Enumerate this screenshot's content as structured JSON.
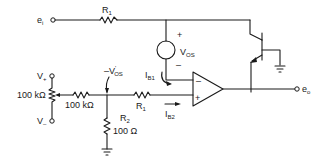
{
  "diagram": {
    "type": "circuit-schematic",
    "labels": {
      "input": "e",
      "input_sub": "i",
      "output": "e",
      "output_sub": "o",
      "r1_top": "R",
      "r1_top_sub": "1",
      "vos": "V",
      "vos_sub": "OS",
      "vos_plus": "+",
      "vos_minus": "–",
      "ib1": "I",
      "ib1_sub": "B1",
      "ib2": "I",
      "ib2_sub": "B2",
      "vos_prime": "–V",
      "vos_prime_sub": "OS",
      "vos_prime_mark": "'",
      "vplus": "V",
      "vplus_sub": "+",
      "vminus": "V",
      "vminus_sub": "–",
      "pot_value": "100 kΩ",
      "series_res_value": "100 kΩ",
      "r1_bottom": "R",
      "r1_bottom_sub": "1",
      "r2": "R",
      "r2_sub": "2",
      "r2_value": "100 Ω",
      "opamp_minus": "–",
      "opamp_plus": "+"
    },
    "components": [
      {
        "id": "R1-feedback",
        "type": "resistor",
        "label": "R1"
      },
      {
        "id": "VOS",
        "type": "voltage-source",
        "label": "VOS"
      },
      {
        "id": "Q1",
        "type": "npn-darlington-transistor"
      },
      {
        "id": "U1",
        "type": "op-amp"
      },
      {
        "id": "POT",
        "type": "potentiometer",
        "value": "100 kΩ"
      },
      {
        "id": "R-series",
        "type": "resistor",
        "value": "100 kΩ"
      },
      {
        "id": "R1-input",
        "type": "resistor",
        "label": "R1"
      },
      {
        "id": "R2",
        "type": "resistor",
        "label": "R2",
        "value": "100 Ω"
      }
    ]
  }
}
